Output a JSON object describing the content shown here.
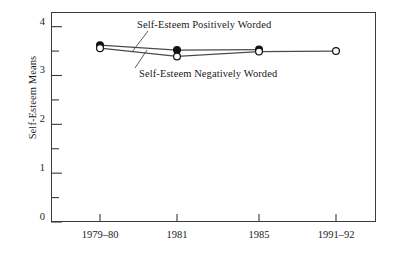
{
  "chart_data": {
    "type": "line",
    "title": "",
    "xlabel": "",
    "ylabel": "Self-Esteem Means",
    "categories": [
      "1979–80",
      "1981",
      "1985",
      "1991–92"
    ],
    "ylim": [
      0,
      4.3
    ],
    "yticks": [
      0,
      1,
      2,
      3,
      4
    ],
    "ytick_labels": [
      "0",
      "1",
      "2",
      "3",
      "4"
    ],
    "yminor_ticks": [
      0.5,
      1.5,
      2.5,
      3.5
    ],
    "grid": false,
    "legend_position": "inline-annotations",
    "series": [
      {
        "name": "Self-Esteem Positively Worded",
        "marker": "filled-circle",
        "values": [
          3.62,
          3.52,
          3.53,
          null
        ]
      },
      {
        "name": "Self-Esteem Negatively Worded",
        "marker": "open-circle",
        "values": [
          3.56,
          3.39,
          3.49,
          3.5
        ]
      }
    ],
    "annotations": [
      {
        "text": "Self-Esteem Positively Worded",
        "series": "Self-Esteem Positively Worded"
      },
      {
        "text": "Self-Esteem Negatively Worded",
        "series": "Self-Esteem Negatively Worded"
      }
    ]
  },
  "axis": {
    "y_title": "Self-Esteem Means",
    "y_labels": [
      "4",
      "3",
      "2",
      "1",
      "0"
    ],
    "x_labels": [
      "1979–80",
      "1981",
      "1985",
      "1991–92"
    ]
  },
  "annotations": {
    "positive": "Self-Esteem Positively Worded",
    "negative": "Self-Esteem Negatively Worded"
  },
  "colors": {
    "axis": "#3a3a3a",
    "line": "#4a4a4a",
    "marker_fill": "#111111",
    "marker_open": "#ffffff",
    "text": "#1a1a1a",
    "background": "#ffffff"
  }
}
